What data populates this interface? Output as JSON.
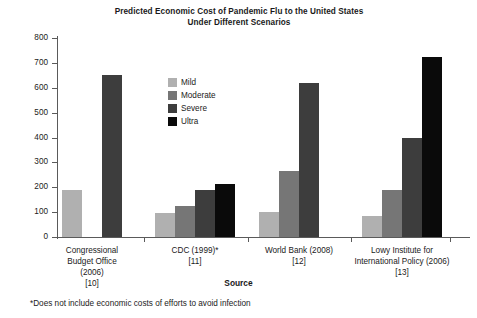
{
  "chart_data": {
    "type": "bar",
    "title": "Predicted Economic Cost of Pandemic Flu to the United States Under Different Scenarios",
    "title_lines": [
      "Predicted Economic Cost of Pandemic Flu to the United States",
      "Under Different Scenarios"
    ],
    "xlabel": "Source",
    "ylabel": "",
    "ylim": [
      0,
      800
    ],
    "yticks": [
      0,
      100,
      200,
      300,
      400,
      500,
      600,
      700,
      800
    ],
    "ytick_labels": [
      "0",
      "100",
      "200",
      "300",
      "400",
      "500",
      "600",
      "700",
      "800"
    ],
    "grid": false,
    "legend_position": "inside-upper-left",
    "categories": [
      "Congressional Budget Office (2006) [10]",
      "CDC (1999)* [11]",
      "World Bank (2008) [12]",
      "Lowy Institute for International Policy (2006) [13]"
    ],
    "category_lines": [
      [
        "Congressional",
        "Budget Office",
        "(2006)",
        "[10]"
      ],
      [
        "CDC (1999)*",
        "[11]"
      ],
      [
        "World Bank (2008)",
        "[12]"
      ],
      [
        "Lowy Institute for",
        "International Policy (2006)",
        "[13]"
      ]
    ],
    "series": [
      {
        "name": "Mild",
        "color": "#b0b0b0",
        "values": [
          190,
          95,
          100,
          85
        ]
      },
      {
        "name": "Moderate",
        "color": "#767676",
        "values": [
          null,
          125,
          265,
          190
        ]
      },
      {
        "name": "Severe",
        "color": "#3d3d3d",
        "values": [
          650,
          190,
          620,
          400
        ]
      },
      {
        "name": "Ultra",
        "color": "#0a0a0a",
        "values": [
          null,
          215,
          null,
          725
        ]
      }
    ],
    "annotations": [
      "*Does not include economic costs of efforts to avoid infection"
    ]
  },
  "footnote": "*Does not include economic costs of efforts to avoid infection",
  "axis": {
    "y_min_label": "0",
    "y_max_label": "800"
  }
}
